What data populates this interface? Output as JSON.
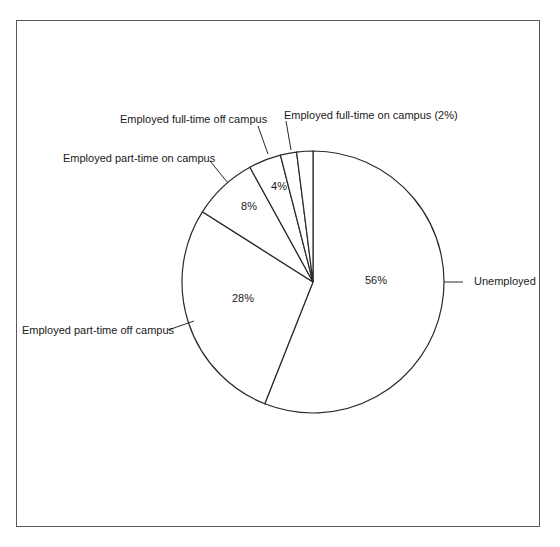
{
  "chart_data": {
    "type": "pie",
    "title": "",
    "categories": [
      "Unemployed",
      "Employed part-time off campus",
      "Employed part-time on campus",
      "Employed full-time off campus",
      "Employed full-time on campus",
      "Other (unlabeled)"
    ],
    "values": [
      56,
      28,
      8,
      4,
      2,
      2
    ],
    "slice_labels": [
      "56%",
      "28%",
      "8%",
      "4%",
      "",
      ""
    ],
    "legend": "none (leader-line labels)",
    "start_angle": "12 o'clock, clockwise",
    "colors": [
      "#ffffff",
      "#ffffff",
      "#ffffff",
      "#ffffff",
      "#ffffff",
      "#ffffff"
    ],
    "stroke_color": "#2a2a2a"
  },
  "labels": {
    "unemployed": "Unemployed",
    "pt_off": "Employed part-time off campus",
    "pt_on": "Employed part-time on campus",
    "ft_off": "Employed full-time off campus",
    "ft_on": "Employed full-time on campus (2%)"
  },
  "percents": {
    "unemployed": "56%",
    "pt_off": "28%",
    "pt_on": "8%",
    "ft_off": "4%"
  }
}
